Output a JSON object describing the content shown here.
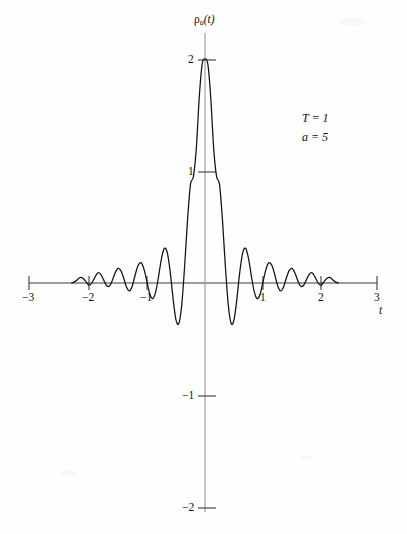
{
  "figure": {
    "background_color": "#fefefe",
    "ink_color": "#111111",
    "axis_color": "#5a5a5a"
  },
  "annotations": {
    "param_T": "T = 1",
    "param_a": "a = 5"
  },
  "axis_labels": {
    "x_name": "t",
    "y_name_base": "ρ",
    "y_name_sub": "u",
    "y_name_arg": "(t)"
  },
  "chart_data": {
    "type": "line",
    "title": "",
    "subtitle": "",
    "xlabel": "t",
    "ylabel": "ρu(t)",
    "xlim": [
      -3,
      3
    ],
    "ylim": [
      -2,
      2
    ],
    "grid": false,
    "legend": null,
    "xticks": [
      -3,
      -2,
      -1,
      1,
      2,
      3
    ],
    "xticklabels": [
      "−3",
      "−2",
      "−1",
      "1",
      "2",
      "3"
    ],
    "yticks": [
      2,
      1,
      -1,
      -2
    ],
    "yticklabels": [
      "2",
      "1",
      "−1",
      "−2"
    ],
    "annotations": [
      "T = 1",
      "a = 5"
    ],
    "peak_value": 2.0,
    "peak_x": 0,
    "symmetry": "even",
    "series": [
      {
        "name": "ρu(t)",
        "color": "#111111",
        "x": [
          -2.3,
          -2.25,
          -2.2,
          -2.15,
          -2.1,
          -2.05,
          -2.0,
          -1.95,
          -1.9,
          -1.85,
          -1.8,
          -1.75,
          -1.7,
          -1.65,
          -1.6,
          -1.55,
          -1.5,
          -1.45,
          -1.4,
          -1.35,
          -1.3,
          -1.25,
          -1.2,
          -1.15,
          -1.1,
          -1.05,
          -1.0,
          -0.95,
          -0.9,
          -0.85,
          -0.8,
          -0.75,
          -0.7,
          -0.65,
          -0.6,
          -0.55,
          -0.5,
          -0.45,
          -0.4,
          -0.35,
          -0.3,
          -0.25,
          -0.2,
          -0.15,
          -0.1,
          -0.05,
          0.0,
          0.05,
          0.1,
          0.15,
          0.2,
          0.25,
          0.3,
          0.35,
          0.4,
          0.45,
          0.5,
          0.55,
          0.6,
          0.65,
          0.7,
          0.75,
          0.8,
          0.85,
          0.9,
          0.95,
          1.0,
          1.05,
          1.1,
          1.15,
          1.2,
          1.25,
          1.3,
          1.35,
          1.4,
          1.45,
          1.5,
          1.55,
          1.6,
          1.65,
          1.7,
          1.75,
          1.8,
          1.85,
          1.9,
          1.95,
          2.0,
          2.05,
          2.1,
          2.15,
          2.2,
          2.25,
          2.3
        ],
        "y": [
          0.0,
          0.01,
          0.03,
          0.05,
          0.04,
          0.01,
          -0.02,
          0.0,
          0.05,
          0.09,
          0.08,
          0.03,
          -0.02,
          -0.03,
          0.02,
          0.09,
          0.13,
          0.11,
          0.04,
          -0.04,
          -0.07,
          -0.02,
          0.08,
          0.16,
          0.18,
          0.12,
          0.01,
          -0.1,
          -0.14,
          -0.08,
          0.06,
          0.22,
          0.31,
          0.27,
          0.1,
          -0.14,
          -0.33,
          -0.36,
          -0.19,
          0.16,
          0.57,
          0.88,
          0.95,
          1.2,
          1.65,
          1.95,
          2.0,
          1.95,
          1.65,
          1.2,
          0.95,
          0.88,
          0.57,
          0.16,
          -0.19,
          -0.36,
          -0.33,
          -0.14,
          0.1,
          0.27,
          0.31,
          0.22,
          0.06,
          -0.08,
          -0.14,
          -0.1,
          0.01,
          0.12,
          0.18,
          0.16,
          0.08,
          -0.02,
          -0.07,
          -0.04,
          0.04,
          0.11,
          0.13,
          0.09,
          0.02,
          -0.03,
          -0.02,
          0.03,
          0.08,
          0.09,
          0.05,
          0.0,
          -0.02,
          0.01,
          0.04,
          0.05,
          0.03,
          0.01,
          0.0
        ]
      }
    ]
  }
}
